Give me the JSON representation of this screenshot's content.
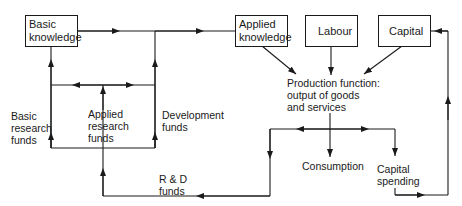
{
  "nodes": {
    "basic_knowledge": {
      "line1": "Basic",
      "line2": "knowledge"
    },
    "applied_knowledge": {
      "line1": "Applied",
      "line2": "knowledge"
    },
    "labour": {
      "label": "Labour"
    },
    "capital": {
      "label": "Capital"
    }
  },
  "labels": {
    "basic_research_funds": [
      "Basic",
      "research",
      "funds"
    ],
    "applied_research_funds": [
      "Applied",
      "research",
      "funds"
    ],
    "development_funds": [
      "Development",
      "funds"
    ],
    "production_function": [
      "Production function:",
      "output of goods",
      "and services"
    ],
    "rd_funds": [
      "R & D",
      "funds"
    ],
    "consumption": "Consumption",
    "capital_spending": [
      "Capital",
      "spending"
    ]
  },
  "colors": {
    "line": "#1a1a1a",
    "background": "#ffffff"
  }
}
